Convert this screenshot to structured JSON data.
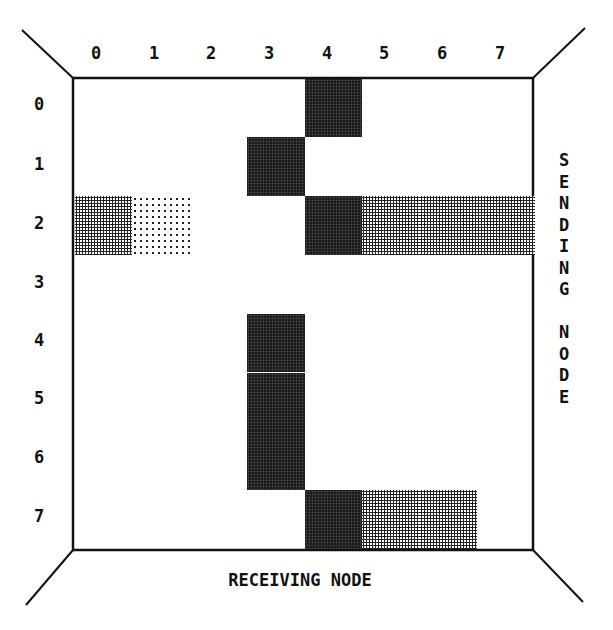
{
  "diagram": {
    "x_axis_label": "RECEIVING NODE",
    "y_axis_label": "SENDING NODE",
    "y_axis_label_vertical": "S\nE\nN\nD\nI\nN\nG\n\nN\nO\nD\nE",
    "columns": [
      "0",
      "1",
      "2",
      "3",
      "4",
      "5",
      "6",
      "7"
    ],
    "rows": [
      "0",
      "1",
      "2",
      "3",
      "4",
      "5",
      "6",
      "7"
    ],
    "shade_levels": {
      "dark": "#1a1a1a",
      "medium": "#7a7a7a",
      "light": "#c4c4c4"
    },
    "cells": [
      {
        "row": 0,
        "col": 4,
        "level": "dark"
      },
      {
        "row": 1,
        "col": 3,
        "level": "dark"
      },
      {
        "row": 2,
        "col": 0,
        "level": "medium"
      },
      {
        "row": 2,
        "col": 1,
        "level": "light"
      },
      {
        "row": 2,
        "col": 4,
        "level": "dark"
      },
      {
        "row": 2,
        "col": 5,
        "level": "medium"
      },
      {
        "row": 2,
        "col": 6,
        "level": "medium"
      },
      {
        "row": 2,
        "col": 7,
        "level": "medium"
      },
      {
        "row": 4,
        "col": 3,
        "level": "dark"
      },
      {
        "row": 5,
        "col": 3,
        "level": "dark"
      },
      {
        "row": 6,
        "col": 3,
        "level": "dark"
      },
      {
        "row": 7,
        "col": 4,
        "level": "dark"
      },
      {
        "row": 7,
        "col": 5,
        "level": "medium"
      },
      {
        "row": 7,
        "col": 6,
        "level": "medium"
      }
    ]
  }
}
